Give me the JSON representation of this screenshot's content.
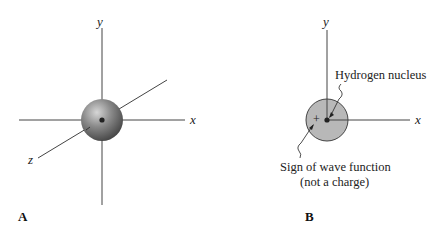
{
  "panel_a": {
    "label": "A",
    "axes": {
      "x": "x",
      "y": "y",
      "z": "z"
    }
  },
  "panel_b": {
    "label": "B",
    "axes": {
      "x": "x",
      "y": "y"
    },
    "sign": "+",
    "annotations": {
      "nucleus": "Hydrogen nucleus",
      "sign_line1": "Sign of wave function",
      "sign_line2": "(not a charge)"
    }
  },
  "colors": {
    "axis": "#444444",
    "sphere": "#7a7a7a",
    "disk": "#b8b8b8"
  }
}
